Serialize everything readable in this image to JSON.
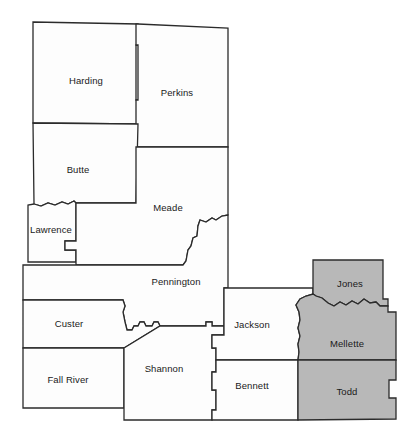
{
  "map": {
    "title": "West River South Dakota County Map",
    "background_color": "#ffffff",
    "border_color": "#2b2b2b",
    "plain_fill": "#fdfdfd",
    "shaded_fill": "#b8b8b8",
    "counties": [
      {
        "name": "Harding",
        "shaded": false,
        "label_x": 86,
        "label_y": 81,
        "path": "M 33,22 L 138,24 L 138,45 L 136,45 L 136,100 L 138,100 L 138,124 L 33,123 Z"
      },
      {
        "name": "Perkins",
        "shaded": false,
        "label_x": 177,
        "label_y": 93,
        "path": "M 138,24 L 228,28 L 228,147 L 136,147 L 136,100 L 138,100 L 138,45 L 136,45 L 136,24 Z"
      },
      {
        "name": "Butte",
        "shaded": false,
        "label_x": 78,
        "label_y": 170,
        "path": "M 33,123 L 138,124 L 136,203 L 76,203 L 74,201 L 68,204 L 62,202 L 55,205 L 48,203 L 41,206 L 34,204 Z"
      },
      {
        "name": "Lawrence",
        "shaded": false,
        "label_x": 51,
        "label_y": 230,
        "path": "M 34,204 L 41,206 L 48,203 L 55,205 L 62,202 L 68,204 L 74,201 L 76,203 L 76,241 L 65,241 L 65,250 L 76,250 L 76,262 L 28,262 L 28,205 Z"
      },
      {
        "name": "Meade",
        "shaded": false,
        "label_x": 168,
        "label_y": 208,
        "path": "M 136,147 L 228,147 L 228,215 L 222,216 L 216,220 L 212,218 L 206,222 L 200,220 L 198,226 L 197,236 L 193,238 L 191,246 L 188,250 L 186,261 L 183,265 L 76,265 L 76,250 L 65,250 L 65,241 L 76,241 L 76,203 L 136,203 Z"
      },
      {
        "name": "Pennington",
        "shaded": false,
        "label_x": 176,
        "label_y": 282,
        "path": "M 23,265 L 76,265 L 183,265 L 186,261 L 188,250 L 191,246 L 193,238 L 197,236 L 198,226 L 200,220 L 206,222 L 212,218 L 216,220 L 222,216 L 228,215 L 228,288 L 224,288 L 224,326 L 212,326 L 212,322 L 206,322 L 206,326 L 160,326 L 158,322 L 154,322 L 152,326 L 146,326 L 144,322 L 140,322 L 138,326 L 134,326 L 132,330 L 127,330 L 125,322 L 123,312 L 125,306 L 123,300 L 23,300 Z"
      },
      {
        "name": "Custer",
        "shaded": false,
        "label_x": 69,
        "label_y": 324,
        "path": "M 23,300 L 123,300 L 125,306 L 123,312 L 125,322 L 127,330 L 132,330 L 134,326 L 138,326 L 140,322 L 144,322 L 146,326 L 152,326 L 154,322 L 158,322 L 160,326 L 124,348 L 23,348 Z"
      },
      {
        "name": "Fall River",
        "shaded": false,
        "label_x": 68,
        "label_y": 380,
        "path": "M 23,348 L 124,348 L 124,408 L 23,408 Z"
      },
      {
        "name": "Shannon",
        "shaded": false,
        "label_x": 164,
        "label_y": 369,
        "path": "M 124,348 L 160,326 L 206,326 L 206,322 L 212,322 L 212,326 L 224,326 L 224,335 L 212,335 L 212,348 L 216,348 L 216,372 L 212,372 L 212,390 L 216,390 L 216,410 L 212,410 L 212,420 L 124,420 Z"
      },
      {
        "name": "Jackson",
        "shaded": false,
        "label_x": 252,
        "label_y": 325,
        "path": "M 228,288 L 313,288 L 313,294 L 306,296 L 300,299 L 296,305 L 299,312 L 300,320 L 298,328 L 300,336 L 298,344 L 299,352 L 298,360 L 216,360 L 216,348 L 212,348 L 212,335 L 224,335 L 224,326 L 224,288 Z"
      },
      {
        "name": "Bennett",
        "shaded": false,
        "label_x": 252,
        "label_y": 386,
        "path": "M 216,360 L 298,360 L 298,420 L 212,420 L 212,410 L 216,410 L 216,390 L 212,390 L 212,372 L 216,372 Z"
      },
      {
        "name": "Jones",
        "shaded": true,
        "label_x": 350,
        "label_y": 284,
        "path": "M 313,260 L 383,260 L 383,299 L 388,299 L 388,306 L 380,306 L 376,302 L 370,303 L 364,299 L 358,304 L 352,301 L 346,305 L 340,302 L 334,306 L 328,303 L 322,298 L 316,296 L 313,294 Z"
      },
      {
        "name": "Mellette",
        "shaded": true,
        "label_x": 347,
        "label_y": 344,
        "path": "M 300,299 L 306,296 L 313,294 L 316,296 L 322,298 L 328,303 L 334,306 L 340,302 L 346,305 L 352,301 L 358,304 L 364,299 L 370,303 L 376,302 L 380,306 L 388,306 L 388,312 L 396,312 L 396,360 L 388,360 L 298,360 L 299,352 L 298,344 L 300,336 L 298,328 L 300,320 L 299,312 L 296,305 Z"
      },
      {
        "name": "Todd",
        "shaded": true,
        "label_x": 347,
        "label_y": 392,
        "path": "M 298,360 L 388,360 L 396,360 L 396,380 L 389,380 L 389,398 L 396,398 L 396,419 L 298,420 Z"
      }
    ]
  }
}
